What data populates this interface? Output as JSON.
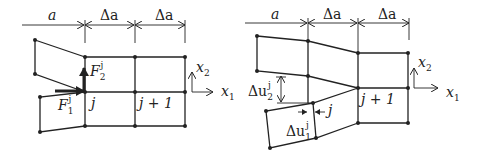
{
  "figures": [
    {
      "name": "undeformed-with-forces",
      "dimensions": [
        "a",
        "Δa",
        "Δa"
      ],
      "node_labels": [
        "j",
        "j + 1"
      ],
      "forces": [
        {
          "symbol": "F",
          "sub": "1",
          "sup": "j"
        },
        {
          "symbol": "F",
          "sub": "2",
          "sup": "j"
        }
      ],
      "axes": [
        {
          "symbol": "x",
          "sub": "1"
        },
        {
          "symbol": "x",
          "sub": "2"
        }
      ]
    },
    {
      "name": "deformed-with-displacement-jumps",
      "dimensions": [
        "a",
        "Δa",
        "Δa"
      ],
      "node_labels": [
        "j",
        "j + 1"
      ],
      "displacements": [
        {
          "prefix": "Δu",
          "sub": "1",
          "sup": "j"
        },
        {
          "prefix": "Δu",
          "sub": "2",
          "sup": "j"
        }
      ],
      "axes": [
        {
          "symbol": "x",
          "sub": "1"
        },
        {
          "symbol": "x",
          "sub": "2"
        }
      ]
    }
  ]
}
